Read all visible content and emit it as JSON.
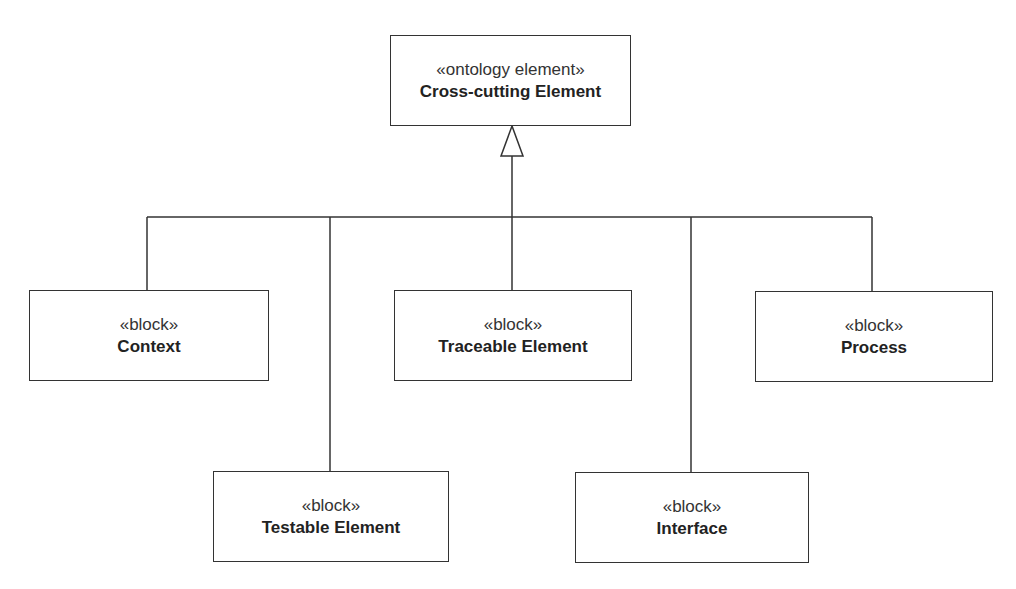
{
  "diagram": {
    "type": "SysML block definition (generalization tree)",
    "parent": {
      "id": "cross-cutting",
      "stereotype": "«ontology element»",
      "name": "Cross-cutting Element",
      "box": {
        "x": 390,
        "y": 35,
        "w": 241,
        "h": 91
      }
    },
    "children": [
      {
        "id": "context",
        "stereotype": "«block»",
        "name": "Context",
        "box": {
          "x": 29,
          "y": 290,
          "w": 240,
          "h": 91
        },
        "anchor_x": 147
      },
      {
        "id": "testable",
        "stereotype": "«block»",
        "name": "Testable Element",
        "box": {
          "x": 213,
          "y": 471,
          "w": 236,
          "h": 91
        },
        "anchor_x": 330
      },
      {
        "id": "traceable",
        "stereotype": "«block»",
        "name": "Traceable Element",
        "box": {
          "x": 394,
          "y": 290,
          "w": 238,
          "h": 91
        },
        "anchor_x": 512
      },
      {
        "id": "interface",
        "stereotype": "«block»",
        "name": "Interface",
        "box": {
          "x": 575,
          "y": 472,
          "w": 234,
          "h": 91
        },
        "anchor_x": 691
      },
      {
        "id": "process",
        "stereotype": "«block»",
        "name": "Process",
        "box": {
          "x": 755,
          "y": 291,
          "w": 238,
          "h": 91
        },
        "anchor_x": 872
      }
    ],
    "relationship": "generalization",
    "bus_y": 217,
    "line_color": "#333333"
  }
}
